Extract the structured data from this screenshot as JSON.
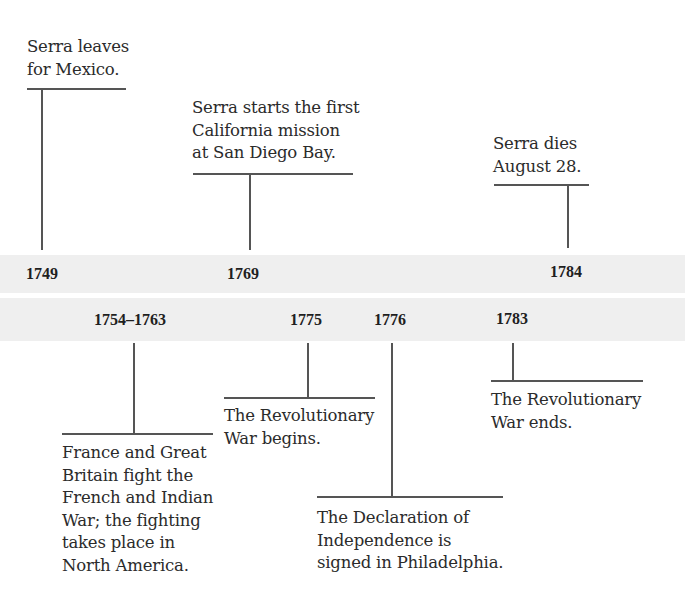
{
  "timeline": {
    "band_color": "#efefef",
    "line_color": "#555555",
    "text_color": "#2b2b2b",
    "top_events": [
      {
        "year": "1749",
        "text": "Serra leaves\nfor Mexico."
      },
      {
        "year": "1769",
        "text": "Serra starts the first\nCalifornia mission\nat San Diego Bay."
      },
      {
        "year": "1784",
        "text": "Serra dies\nAugust 28."
      }
    ],
    "bottom_events": [
      {
        "year": "1754–1763",
        "text": "France and Great\nBritain fight the\nFrench and Indian\nWar; the fighting\ntakes place in\nNorth America."
      },
      {
        "year": "1775",
        "text": "The Revolutionary\nWar begins."
      },
      {
        "year": "1776",
        "text": "The Declaration of\nIndependence is\nsigned in Philadelphia."
      },
      {
        "year": "1783",
        "text": "The Revolutionary\nWar ends."
      }
    ]
  }
}
